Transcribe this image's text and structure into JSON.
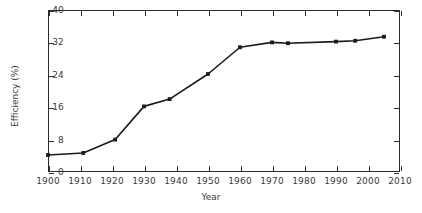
{
  "chart_data": {
    "type": "line",
    "title": "",
    "xlabel": "Year",
    "ylabel": "Efficiency (%)",
    "xlim": [
      1900,
      2010
    ],
    "ylim": [
      0,
      40
    ],
    "xticks": [
      1900,
      1910,
      1920,
      1930,
      1940,
      1950,
      1960,
      1970,
      1980,
      1990,
      2000,
      2010
    ],
    "yticks": [
      0,
      8,
      16,
      24,
      32,
      40
    ],
    "grid": false,
    "legend": null,
    "marker": "square",
    "line_color": "#1a1a1a",
    "series": [
      {
        "name": "Efficiency",
        "x": [
          1900,
          1911,
          1921,
          1930,
          1938,
          1950,
          1960,
          1970,
          1975,
          1990,
          1996,
          2005
        ],
        "y": [
          4.2,
          4.7,
          8.0,
          16.2,
          18.0,
          24.2,
          30.8,
          32.0,
          31.8,
          32.2,
          32.4,
          33.4
        ]
      }
    ]
  },
  "axis": {
    "x_tick_labels": [
      "1900",
      "1910",
      "1920",
      "1930",
      "1940",
      "1950",
      "1960",
      "1970",
      "1980",
      "1990",
      "2000",
      "2010"
    ],
    "y_tick_labels": [
      "0",
      "8",
      "16",
      "24",
      "32",
      "40"
    ],
    "x_title": "Year",
    "y_title": "Efficiency (%)"
  }
}
